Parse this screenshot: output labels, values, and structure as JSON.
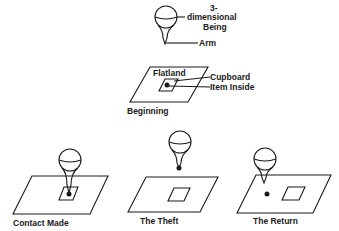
{
  "diagram": {
    "type": "illustration",
    "labels": {
      "being_line1": "3-",
      "being_line2": "dimensional",
      "being_line3": "Being",
      "arm": "Arm",
      "flatland": "Flatland",
      "cupboard": "Cupboard",
      "item": "Item   Inside"
    },
    "panels": [
      {
        "id": "beginning",
        "caption": "Beginning"
      },
      {
        "id": "contact",
        "caption": "Contact   Made"
      },
      {
        "id": "theft",
        "caption": "The   Theft"
      },
      {
        "id": "return",
        "caption": "The   Return"
      }
    ]
  }
}
